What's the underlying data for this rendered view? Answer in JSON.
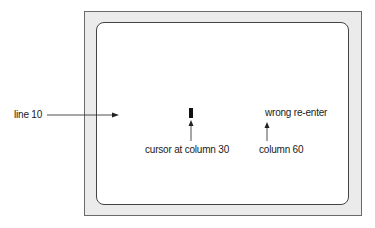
{
  "diagram": {
    "labels": {
      "line": "line 10",
      "cursor": "cursor at column 30",
      "message": "wrong re-enter",
      "column": "column 60"
    },
    "colors": {
      "frame_fill": "#ebebeb",
      "screen_fill": "#ffffff",
      "ink": "#1a1a1a"
    }
  }
}
